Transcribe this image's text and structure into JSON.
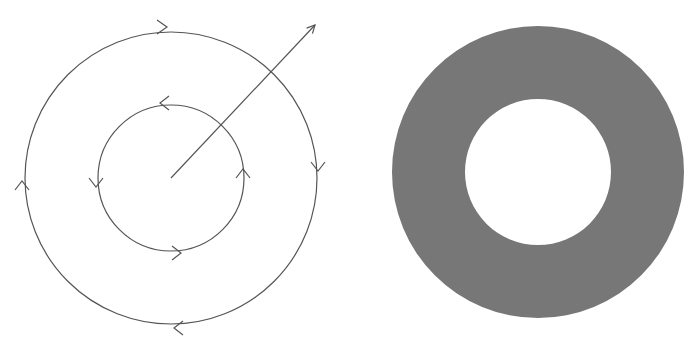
{
  "figure": {
    "left_panel": {
      "description": "Concentric circular contours with direction arrows and a radial arrow",
      "center": [
        171,
        178
      ],
      "outer_circle": {
        "radius": 146,
        "direction": "clockwise"
      },
      "inner_circle": {
        "radius": 73,
        "direction": "counterclockwise"
      },
      "radial_arrow": {
        "from": [
          171,
          178
        ],
        "to": [
          315,
          25
        ]
      },
      "stroke_color": "#555555"
    },
    "right_panel": {
      "description": "Filled annulus (ring) region",
      "center": [
        538,
        172
      ],
      "outer_radius": 146,
      "inner_radius": 73,
      "fill_color": "#777777"
    }
  }
}
